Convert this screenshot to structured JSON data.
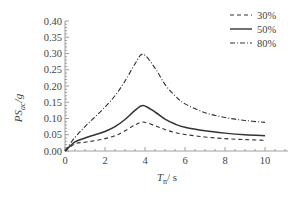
{
  "chart_data": {
    "type": "line",
    "title": "",
    "xlabel": "T_n / s",
    "ylabel": "PS_ac / g",
    "xlim": [
      0,
      11
    ],
    "ylim": [
      0,
      0.4
    ],
    "xticks": [
      "0",
      "2",
      "4",
      "6",
      "8",
      "10"
    ],
    "yticks": [
      "0.00",
      "0.05",
      "0.10",
      "0.15",
      "0.20",
      "0.25",
      "0.30",
      "0.35",
      "0.40"
    ],
    "grid": false,
    "legend_position": "upper right",
    "x": [
      0,
      0.5,
      1,
      1.5,
      2,
      2.5,
      3,
      3.5,
      3.9,
      4.5,
      5,
      5.5,
      6,
      7,
      8,
      9,
      10
    ],
    "series": [
      {
        "name": "30%",
        "style": "dashed",
        "values": [
          0,
          0.022,
          0.027,
          0.032,
          0.038,
          0.047,
          0.062,
          0.08,
          0.089,
          0.078,
          0.066,
          0.057,
          0.051,
          0.043,
          0.038,
          0.035,
          0.033
        ]
      },
      {
        "name": "50%",
        "style": "solid",
        "values": [
          0,
          0.028,
          0.04,
          0.05,
          0.06,
          0.075,
          0.097,
          0.125,
          0.14,
          0.12,
          0.098,
          0.083,
          0.073,
          0.062,
          0.055,
          0.05,
          0.047
        ]
      },
      {
        "name": "80%",
        "style": "dashdot",
        "values": [
          0,
          0.042,
          0.075,
          0.105,
          0.135,
          0.17,
          0.215,
          0.268,
          0.298,
          0.255,
          0.205,
          0.17,
          0.145,
          0.118,
          0.103,
          0.094,
          0.088
        ]
      }
    ]
  },
  "labels": {
    "ylabel_main": "PS",
    "ylabel_sub": "ac",
    "ylabel_tail": "/g",
    "xlabel_main": "T",
    "xlabel_sub": "n",
    "xlabel_tail": "/ s"
  },
  "legend": [
    {
      "label": "30%"
    },
    {
      "label": "50%"
    },
    {
      "label": "80%"
    }
  ]
}
